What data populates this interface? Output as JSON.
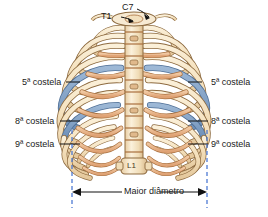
{
  "figure": {
    "background": "#ffffff",
    "vertebra_labels": {
      "c7": "C7",
      "t1": "T1",
      "l1": "L1"
    },
    "rib_labels_left": [
      {
        "text": "5ª costela",
        "x": 22,
        "y": 78
      },
      {
        "text": "8ª costela",
        "x": 15,
        "y": 117
      },
      {
        "text": "9ª costela",
        "x": 15,
        "y": 140
      }
    ],
    "rib_labels_right": [
      {
        "text": "5ª costela",
        "x": 212,
        "y": 78
      },
      {
        "text": "8ª costela",
        "x": 212,
        "y": 117
      },
      {
        "text": "9ª costela",
        "x": 212,
        "y": 140
      }
    ],
    "measure": {
      "caption": "Maior diâmetro",
      "left_x": 72,
      "right_x": 207,
      "axis_y": 192,
      "guide_top": 130,
      "guide_bottom": 208,
      "guide_color": "#3f6fd0"
    },
    "colors": {
      "bone": "#f6e3c4",
      "bone_shade": "#e8cfa4",
      "bone_outline": "#8d6a3f",
      "cartilage": "#e8b68a",
      "cartilage_outline": "#a9703f",
      "highlight_blue": "#7f9ec4",
      "highlight_blue_outline": "#4f6f96",
      "spine": "#f3e0bd",
      "leader": "#111111",
      "text": "#1a1a1a"
    },
    "icon_names": {
      "left_arrow": "arrow-left-icon",
      "right_arrow": "arrow-right-icon",
      "dashed_guide": "dashed-guide-line-icon"
    }
  }
}
